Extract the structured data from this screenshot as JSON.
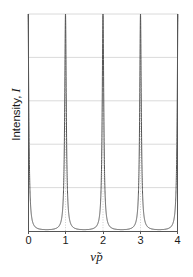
{
  "chart_data": {
    "type": "line",
    "title": "",
    "subtitle": "",
    "xlabel_text": "ν̃p",
    "xlabel_symbol": "ν̃",
    "xlabel_suffix": "p",
    "ylabel_text": "Intensity, I",
    "ylabel_prefix": "Intensity, ",
    "ylabel_symbol": "I",
    "xlim": [
      0,
      4
    ],
    "ylim": [
      0,
      1
    ],
    "xticks": [
      0,
      1,
      2,
      3,
      4
    ],
    "xtick_labels": [
      "0",
      "1",
      "2",
      "3",
      "4"
    ],
    "yticks": [],
    "ytick_labels": [],
    "grid": true,
    "grid_x_values": [
      1,
      2,
      3
    ],
    "grid_y_values": [
      0.2,
      0.4,
      0.6,
      0.8,
      1.0
    ],
    "grid_style": "dotted",
    "legend": null,
    "legend_position": "none",
    "series": [
      {
        "name": "Airy transmission",
        "function": "1 / (1 + F * sin(pi*x)^2)",
        "finesse_F": 160,
        "period": 1,
        "peak_value": 1.0,
        "peak_x": [
          0,
          1,
          2,
          3,
          4
        ],
        "min_value": 0.0062,
        "min_x": [
          0.5,
          1.5,
          2.5,
          3.5
        ],
        "color": "#555555",
        "linewidth": 1.0,
        "x": [
          0.0,
          0.02,
          0.04,
          0.06,
          0.08,
          0.1,
          0.12,
          0.14,
          0.16,
          0.18,
          0.2,
          0.25,
          0.3,
          0.35,
          0.4,
          0.45,
          0.5,
          0.55,
          0.6,
          0.65,
          0.7,
          0.75,
          0.8,
          0.82,
          0.84,
          0.86,
          0.88,
          0.9,
          0.92,
          0.94,
          0.96,
          0.98,
          1.0
        ],
        "y": [
          1.0,
          0.908,
          0.707,
          0.499,
          0.345,
          0.24,
          0.172,
          0.127,
          0.096,
          0.074,
          0.059,
          0.034,
          0.021,
          0.014,
          0.0094,
          0.0071,
          0.0062,
          0.0071,
          0.0094,
          0.014,
          0.021,
          0.034,
          0.059,
          0.074,
          0.096,
          0.127,
          0.172,
          0.24,
          0.345,
          0.499,
          0.707,
          0.908,
          1.0
        ]
      }
    ],
    "plot_area": {
      "left": 28,
      "top": 14,
      "right": 178,
      "bottom": 231
    },
    "axes_color": "#4a4a4a",
    "grid_color": "#d4d4d4",
    "background": "#ffffff"
  },
  "axis": {
    "x_tick_labels": [
      {
        "value": "0",
        "x": 0
      },
      {
        "value": "1",
        "x": 1
      },
      {
        "value": "2",
        "x": 2
      },
      {
        "value": "3",
        "x": 3
      },
      {
        "value": "4",
        "x": 4
      }
    ]
  }
}
